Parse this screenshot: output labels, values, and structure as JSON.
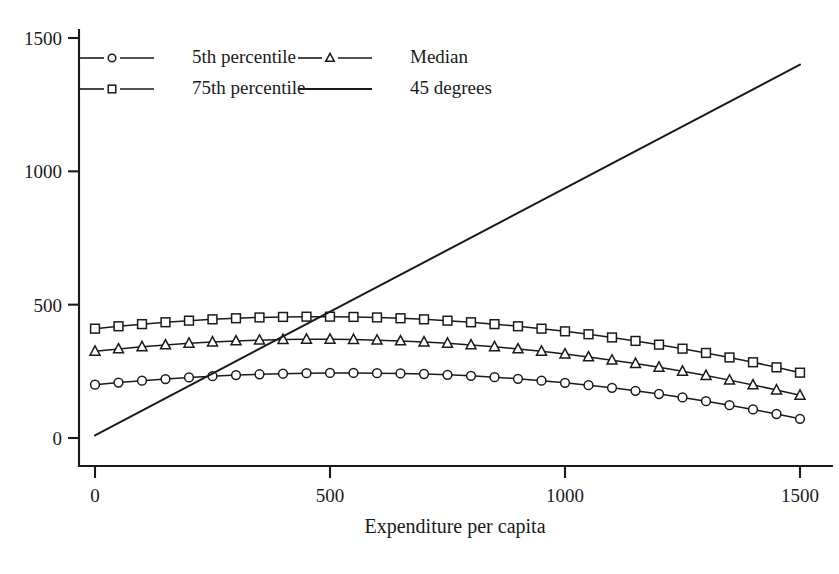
{
  "chart_data": {
    "type": "line",
    "title": "",
    "xlabel": "Expenditure per capita",
    "ylabel": "",
    "xlim": [
      0,
      1500
    ],
    "ylim": [
      -130,
      1560
    ],
    "xticks": [
      0,
      500,
      1000,
      1500
    ],
    "xtick_labels": [
      "0",
      "500",
      "1000",
      "1500"
    ],
    "yticks": [
      0,
      500,
      1000,
      1500
    ],
    "ytick_labels": [
      "0",
      "500",
      "1000",
      "1500"
    ],
    "grid": false,
    "legend_position": "upper-left",
    "x": [
      0,
      50,
      100,
      150,
      200,
      250,
      300,
      350,
      400,
      450,
      500,
      550,
      600,
      650,
      700,
      750,
      800,
      850,
      900,
      950,
      1000,
      1050,
      1100,
      1150,
      1200,
      1250,
      1300,
      1350,
      1400,
      1450,
      1500
    ],
    "series": [
      {
        "name": "5th percentile",
        "marker": "circle",
        "values": [
          200,
          208,
          215,
          221,
          227,
          232,
          236,
          239,
          241,
          243,
          244,
          244,
          243,
          242,
          240,
          237,
          233,
          228,
          222,
          215,
          207,
          198,
          188,
          177,
          165,
          152,
          138,
          123,
          107,
          90,
          72
        ]
      },
      {
        "name": "Median",
        "marker": "triangle",
        "values": [
          325,
          334,
          342,
          349,
          355,
          360,
          364,
          367,
          369,
          370,
          370,
          369,
          367,
          364,
          360,
          355,
          349,
          342,
          334,
          325,
          315,
          304,
          292,
          279,
          265,
          250,
          234,
          217,
          199,
          180,
          160
        ]
      },
      {
        "name": "75th percentile",
        "marker": "square",
        "values": [
          410,
          419,
          427,
          434,
          440,
          445,
          449,
          452,
          454,
          455,
          455,
          454,
          452,
          449,
          445,
          440,
          434,
          427,
          419,
          410,
          400,
          389,
          377,
          364,
          350,
          335,
          319,
          302,
          284,
          265,
          245
        ]
      }
    ],
    "reference_line": {
      "name": "45 degrees",
      "marker": "none",
      "x": [
        0,
        1500
      ],
      "values": [
        10,
        1400
      ]
    },
    "legend_entries": [
      {
        "label": "5th percentile",
        "marker": "circle"
      },
      {
        "label": "Median",
        "marker": "triangle"
      },
      {
        "label": "75th percentile",
        "marker": "square"
      },
      {
        "label": "45 degrees",
        "marker": "none"
      }
    ],
    "colors": {
      "ink": "#1a1a1a",
      "background": "#ffffff",
      "marker_fill": "#ffffff"
    }
  }
}
